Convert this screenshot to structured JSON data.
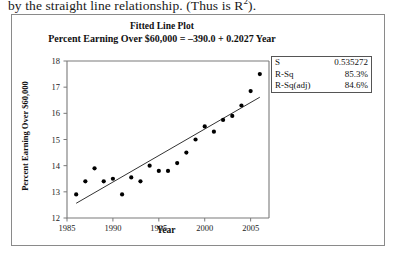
{
  "document": {
    "body_text_fragment": "by the straight line relationship. (Thus is R",
    "body_text_superscript": "2",
    "body_text_tail": ")."
  },
  "figure": {
    "title": "Fitted Line Plot",
    "subtitle": "Percent Earning Over $60,000 = –390.0 + 0.2027 Year",
    "stats": [
      {
        "label": "S",
        "value": "0.535272"
      },
      {
        "label": "R-Sq",
        "value": "85.3%"
      },
      {
        "label": "R-Sq(adj)",
        "value": "84.6%"
      }
    ]
  },
  "chart_data": {
    "type": "scatter",
    "title": "Fitted Line Plot",
    "subtitle": "Percent Earning Over $60,000 = –390.0 + 0.2027 Year",
    "xlabel": "Year",
    "ylabel": "Percent Earning Over $60,000",
    "xlim": [
      1985,
      2007
    ],
    "ylim": [
      12,
      18
    ],
    "xticks": [
      1985,
      1990,
      1995,
      2000,
      2005
    ],
    "yticks": [
      12,
      13,
      14,
      15,
      16,
      17,
      18
    ],
    "grid": false,
    "legend": false,
    "marker": "filled-circle",
    "marker_color": "#000000",
    "line_color": "#333333",
    "fit_line": {
      "type": "linear",
      "intercept": -390.0,
      "slope": 0.2027,
      "equation": "Percent Earning Over $60,000 = –390.0 + 0.2027 Year",
      "x_start": 1986,
      "x_end": 2006
    },
    "statistics": {
      "S": 0.535272,
      "R_Sq": "85.3%",
      "R_Sq_adj": "84.6%"
    },
    "x": [
      1986,
      1987,
      1988,
      1989,
      1990,
      1991,
      1992,
      1993,
      1994,
      1995,
      1996,
      1997,
      1998,
      1999,
      2000,
      2001,
      2002,
      2003,
      2004,
      2005,
      2006
    ],
    "y": [
      12.9,
      13.4,
      13.9,
      13.4,
      13.5,
      12.9,
      13.55,
      13.4,
      14.0,
      13.8,
      13.8,
      14.1,
      14.5,
      15.0,
      15.5,
      15.3,
      15.75,
      15.9,
      16.3,
      16.85,
      17.5
    ]
  }
}
